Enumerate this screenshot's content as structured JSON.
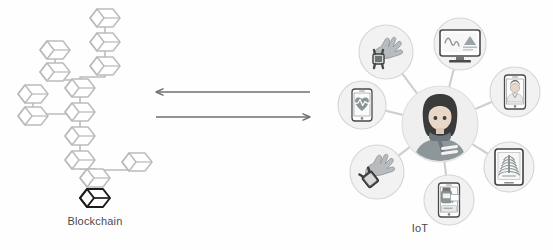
{
  "figure": {
    "background_color": "#fefefe",
    "panels": [
      {
        "id": "blockchain",
        "label": "Blockchain"
      },
      {
        "id": "iot",
        "label": "IoT"
      }
    ]
  },
  "blockchain": {
    "label": "Blockchain",
    "block_color": "#b9bcbe",
    "highlight_color": "#1c1c1c",
    "link_color": "#b9bcbe",
    "block_count": 20,
    "highlighted_block_name": "genesis-block",
    "blocks": [
      {
        "id": "b1",
        "x": 105,
        "y": 18,
        "highlight": false
      },
      {
        "id": "b2",
        "x": 105,
        "y": 42,
        "highlight": false
      },
      {
        "id": "b3",
        "x": 105,
        "y": 66,
        "highlight": false
      },
      {
        "id": "b4",
        "x": 55,
        "y": 50,
        "highlight": false
      },
      {
        "id": "b5",
        "x": 55,
        "y": 72,
        "highlight": false
      },
      {
        "id": "b6",
        "x": 80,
        "y": 88,
        "highlight": false
      },
      {
        "id": "b7",
        "x": 33,
        "y": 94,
        "highlight": false
      },
      {
        "id": "b8",
        "x": 33,
        "y": 116,
        "highlight": false
      },
      {
        "id": "b9",
        "x": 80,
        "y": 112,
        "highlight": false
      },
      {
        "id": "b10",
        "x": 80,
        "y": 136,
        "highlight": false
      },
      {
        "id": "b11",
        "x": 80,
        "y": 160,
        "highlight": false
      },
      {
        "id": "b12",
        "x": 95,
        "y": 178,
        "highlight": false
      },
      {
        "id": "b13",
        "x": 137,
        "y": 162,
        "highlight": false
      },
      {
        "id": "b14",
        "x": 95,
        "y": 198,
        "highlight": true
      }
    ]
  },
  "arrows": {
    "color": "#6f6f6f",
    "items": [
      {
        "id": "arrow-left",
        "direction": "left",
        "x1": 310,
        "x2": 156,
        "y": 92,
        "name": "iot-to-blockchain-arrow"
      },
      {
        "id": "arrow-right",
        "direction": "right",
        "x1": 156,
        "x2": 310,
        "y": 117,
        "name": "blockchain-to-iot-arrow"
      }
    ]
  },
  "iot": {
    "label": "IoT",
    "hub": {
      "name": "patient-avatar",
      "cx": 440,
      "cy": 124,
      "r": 38,
      "circle_fill": "#f0eff0",
      "hair_color": "#3b3b3b",
      "skin_color": "#e9d8c8",
      "body_color": "#8d9699",
      "scarf_color": "#6e787c"
    },
    "link_color": "#cfcfcf",
    "node_circle_fill": "#f3f2f3",
    "node_circle_stroke": "#d6d5d6",
    "nodes": [
      {
        "id": "n1",
        "name": "smartwatch-hand-icon",
        "cx": 386,
        "cy": 52,
        "r": 27,
        "device": "hand-with-smartwatch",
        "label": "wearable smartwatch"
      },
      {
        "id": "n2",
        "name": "desktop-monitor-icon",
        "cx": 460,
        "cy": 44,
        "r": 26,
        "device": "desktop-monitor",
        "label": "clinician workstation"
      },
      {
        "id": "n3",
        "name": "phone-heartrate-icon",
        "cx": 362,
        "cy": 105,
        "r": 24,
        "device": "phone-with-heart",
        "label": "heart rate app"
      },
      {
        "id": "n4",
        "name": "phone-doctor-icon",
        "cx": 515,
        "cy": 92,
        "r": 25,
        "device": "phone-with-doctor",
        "label": "telemedicine call"
      },
      {
        "id": "n5",
        "name": "tablet-xray-icon",
        "cx": 509,
        "cy": 167,
        "r": 25,
        "device": "tablet-with-ribcage",
        "label": "chest x-ray viewer"
      },
      {
        "id": "n6",
        "name": "phone-medication-icon",
        "cx": 449,
        "cy": 200,
        "r": 25,
        "device": "phone-with-medicine",
        "label": "medication reminder"
      },
      {
        "id": "n7",
        "name": "wristband-hand-icon",
        "cx": 377,
        "cy": 172,
        "r": 27,
        "device": "hand-with-wristband",
        "label": "fitness wristband"
      }
    ]
  }
}
